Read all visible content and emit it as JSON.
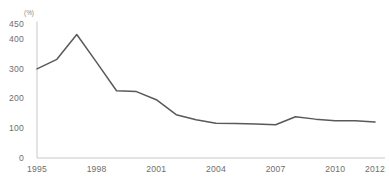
{
  "chart_data": {
    "type": "line",
    "title": "",
    "subtitle": "",
    "xlabel": "",
    "ylabel": "",
    "unit_label": "(%)",
    "x": [
      1995,
      1996,
      1997,
      1998,
      1999,
      2000,
      2001,
      2002,
      2003,
      2004,
      2005,
      2006,
      2007,
      2008,
      2009,
      2010,
      2011,
      2012
    ],
    "values": [
      298,
      330,
      413,
      320,
      225,
      222,
      195,
      145,
      128,
      116,
      115,
      114,
      111,
      138,
      130,
      125,
      125,
      120
    ],
    "series": [
      {
        "name": "",
        "values": [
          298,
          330,
          413,
          320,
          225,
          222,
          195,
          145,
          128,
          116,
          115,
          114,
          111,
          138,
          130,
          125,
          125,
          120
        ]
      }
    ],
    "xlim": [
      1995,
      2012
    ],
    "ylim": [
      0,
      450
    ],
    "x_tick_labels": [
      "1995",
      "1998",
      "2001",
      "2004",
      "2007",
      "2010",
      "2012"
    ],
    "x_tick_values": [
      1995,
      1998,
      2001,
      2004,
      2007,
      2010,
      2012
    ],
    "y_tick_labels": [
      "0",
      "100",
      "200",
      "300",
      "400",
      "450"
    ],
    "y_tick_values": [
      0,
      100,
      200,
      300,
      400,
      450
    ],
    "grid": false,
    "legend": false,
    "legend_position": "none",
    "line_color": "#595959",
    "axis_color": "#c8c8c8",
    "label_color": "#6e6e6e"
  },
  "axis": {
    "y_labels": [
      {
        "text": "450",
        "value": 450
      },
      {
        "text": "400",
        "value": 400
      },
      {
        "text": "300",
        "value": 300
      },
      {
        "text": "200",
        "value": 200
      },
      {
        "text": "100",
        "value": 100
      },
      {
        "text": "0",
        "value": 0
      }
    ],
    "x_labels": [
      {
        "text": "1995",
        "value": 1995
      },
      {
        "text": "1998",
        "value": 1998
      },
      {
        "text": "2001",
        "value": 2001
      },
      {
        "text": "2004",
        "value": 2004
      },
      {
        "text": "2007",
        "value": 2007
      },
      {
        "text": "2010",
        "value": 2010
      },
      {
        "text": "2012",
        "value": 2012
      }
    ],
    "unit": "(%)"
  }
}
